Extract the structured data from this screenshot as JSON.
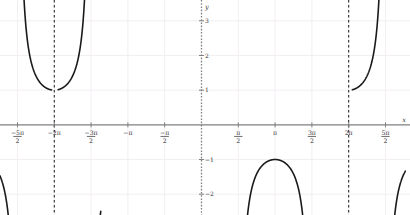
{
  "figure": {
    "background_color": "#ffffff",
    "axis_color": "#808080",
    "grid_color": "#f2eef2",
    "curve_color": "#1a1a1a",
    "asymptote_color": "#1a1a1a",
    "tick_label_color": "#333333"
  },
  "axis_labels": {
    "x": "x",
    "y": "y"
  },
  "chart_data": {
    "type": "line",
    "title": "",
    "xlabel": "x",
    "ylabel": "y",
    "grid": true,
    "legend": "none",
    "function": "y = sec(x)",
    "xlim": [
      -8.6,
      8.9
    ],
    "ylim": [
      -2.6,
      3.6
    ],
    "x_ticks": [
      {
        "value": -7.853981634,
        "label": "−5π/2",
        "num": "−5π",
        "den": "2",
        "mixed": true
      },
      {
        "value": -6.283185307,
        "label": "−2π",
        "num": "−2π",
        "den": "",
        "mixed": false
      },
      {
        "value": -4.71238898,
        "label": "−3π/2",
        "num": "−3π",
        "den": "2",
        "mixed": true
      },
      {
        "value": -3.141592654,
        "label": "−π",
        "num": "−π",
        "den": "",
        "mixed": false
      },
      {
        "value": -1.570796327,
        "label": "−π/2",
        "num": "−π",
        "den": "2",
        "mixed": true
      },
      {
        "value": 1.570796327,
        "label": "π/2",
        "num": "π",
        "den": "2",
        "mixed": true
      },
      {
        "value": 3.141592654,
        "label": "π",
        "num": "π",
        "den": "",
        "mixed": false
      },
      {
        "value": 4.71238898,
        "label": "3π/2",
        "num": "3π",
        "den": "2",
        "mixed": true
      },
      {
        "value": 6.283185307,
        "label": "2π",
        "num": "2π",
        "den": "",
        "mixed": false
      },
      {
        "value": 7.853981634,
        "label": "5π/2",
        "num": "5π",
        "den": "2",
        "mixed": true
      }
    ],
    "y_ticks": [
      {
        "value": -2,
        "label": "−2"
      },
      {
        "value": -1,
        "label": "−1"
      },
      {
        "value": 1,
        "label": "1"
      },
      {
        "value": 2,
        "label": "2"
      },
      {
        "value": 3,
        "label": "3"
      }
    ],
    "asymptotes": [
      {
        "x": -6.283185307,
        "style": "dashed"
      },
      {
        "x": 6.283185307,
        "style": "dashed"
      }
    ],
    "series": [
      {
        "name": "sec(x) branch 1",
        "x_range": [
          -8.6,
          -6.4
        ],
        "note": "rising branch toward asymptote at -2π, upper-left"
      },
      {
        "name": "sec(x) branch 2",
        "x_range": [
          -6.12,
          -4.3
        ],
        "note": "downward arch, local maximum (−π, −1)",
        "vertex": [
          -3.141592654,
          -1
        ]
      },
      {
        "name": "sec(x) branch 3",
        "x_range": [
          1.72,
          4.58
        ],
        "note": "upward U, local minimum (π, 1)",
        "vertex": [
          3.141592654,
          1
        ]
      },
      {
        "name": "sec(x) branch 4",
        "x_range": [
          6.44,
          8.7
        ],
        "note": "rising branch from asymptote at 2π, lower-right"
      }
    ]
  }
}
